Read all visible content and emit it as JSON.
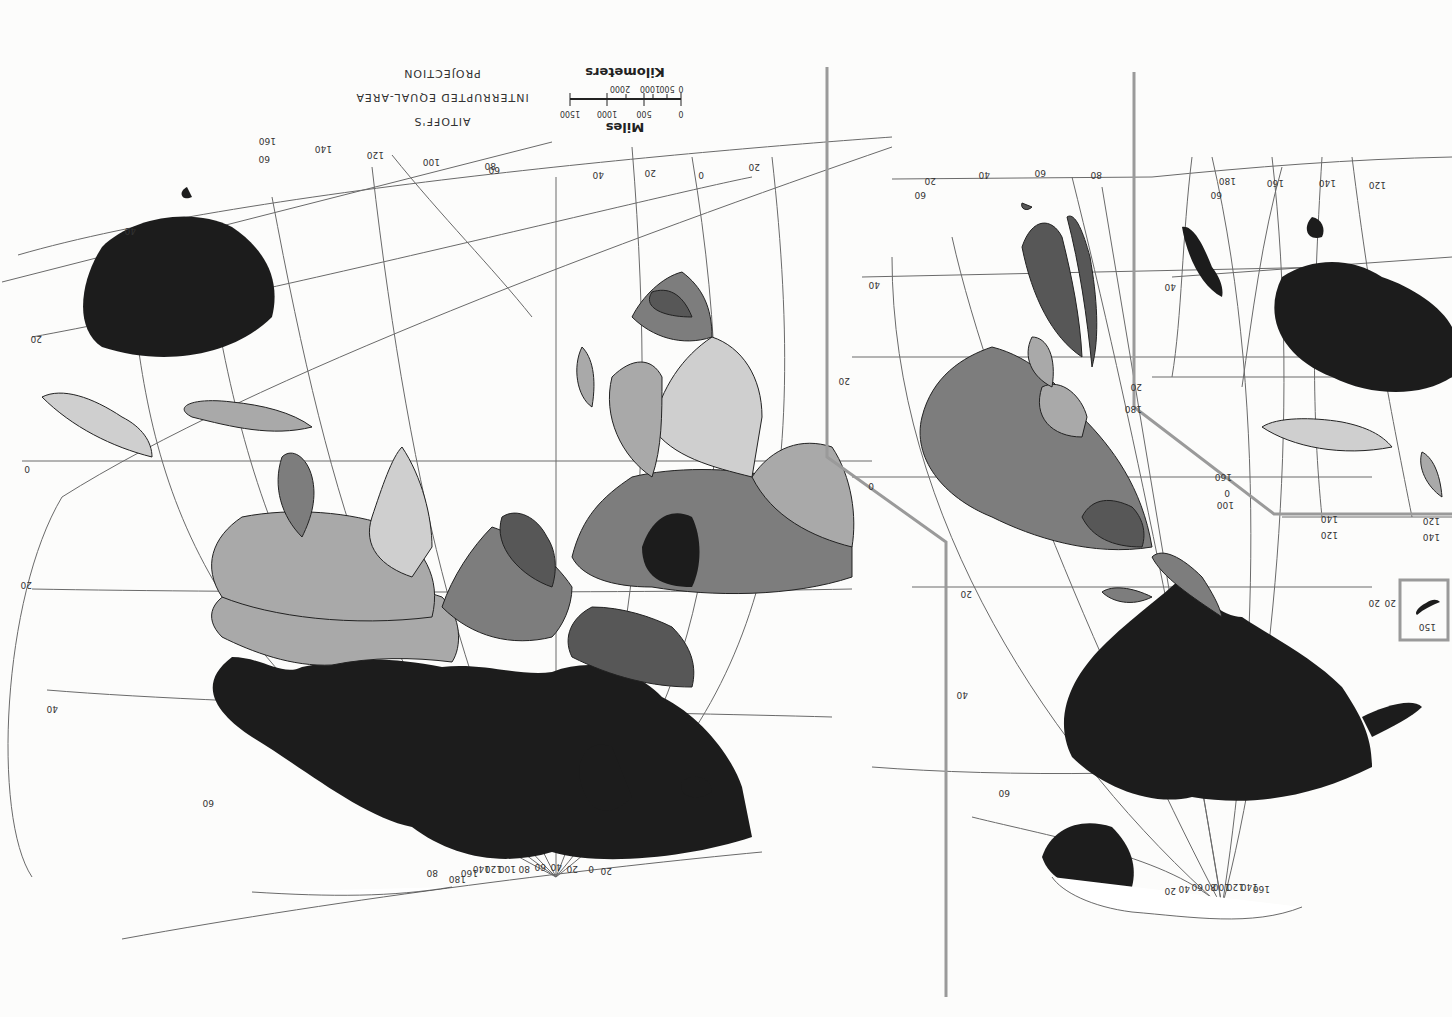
{
  "map": {
    "orientation": "rotated 180 degrees (upside down)",
    "projection_title": [
      "AITOFF'S",
      "INTERRUPTED EQUAL-AREA",
      "PROJECTION"
    ],
    "scale": {
      "miles_label": "Miles",
      "miles_ticks": [
        "0",
        "500",
        "1000",
        "1500"
      ],
      "km_label": "Kilometers",
      "km_ticks": [
        "0",
        "500",
        "1000",
        "2000"
      ]
    },
    "palette": {
      "black": "#1c1c1c",
      "dark": "#575757",
      "mid": "#7d7d7d",
      "light": "#a9a9a9",
      "pale": "#cfcfcf",
      "background": "#fcfcfb",
      "frame": "#9a9a9a"
    },
    "lobes": {
      "eastern_hemisphere": {
        "longitude_labels_top": [
          "20",
          "0",
          "20",
          "40",
          "60",
          "80",
          "100",
          "120",
          "140",
          "160"
        ],
        "latitude_labels": [
          "60",
          "40",
          "20",
          "0",
          "20",
          "40",
          "60"
        ],
        "pole_fan_labels": [
          "80",
          "180",
          "160",
          "140",
          "120",
          "100",
          "80",
          "60",
          "40",
          "20",
          "0",
          "20"
        ]
      },
      "americas": {
        "longitude_labels_top": [
          "20",
          "40",
          "60",
          "80"
        ],
        "latitude_labels": [
          "60",
          "40",
          "20",
          "0",
          "20",
          "40",
          "60"
        ],
        "pole_fan_labels": [
          "160",
          "140",
          "120",
          "100",
          "80",
          "60",
          "40",
          "20"
        ]
      },
      "pacific": {
        "longitude_labels_top": [
          "180",
          "160",
          "140",
          "120"
        ],
        "latitude_labels": [
          "60",
          "40",
          "20",
          "0"
        ],
        "lower_labels": [
          "180",
          "160",
          "100",
          "140",
          "120",
          "120",
          "140"
        ],
        "inset_labels": [
          "20",
          "150",
          "20"
        ]
      }
    }
  }
}
